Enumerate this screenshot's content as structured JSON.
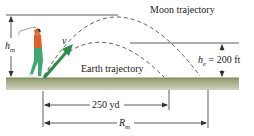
{
  "diagram": {
    "labels": {
      "moon_trajectory": "Moon trajectory",
      "earth_trajectory": "Earth trajectory",
      "velocity": "v",
      "h_m_main": "h",
      "h_m_sub": "m",
      "h_e_main": "h",
      "h_e_sub": "e",
      "h_e_value": " = 200 ft",
      "earth_range": "250 yd",
      "moon_range_main": "R",
      "moon_range_sub": "m"
    },
    "colors": {
      "ground_top": "#8e9a6c",
      "ground_bottom": "#d4d2bf",
      "velocity_arrow": "#2e8b4a",
      "golfer_shirt": "#e0602a",
      "golfer_pants": "#3fa872",
      "golfer_skin": "#d9a07a",
      "golfer_hair": "#222222",
      "line": "#333333"
    },
    "quantities": {
      "h_e": "200 ft",
      "earth_range": "250 yd"
    }
  }
}
